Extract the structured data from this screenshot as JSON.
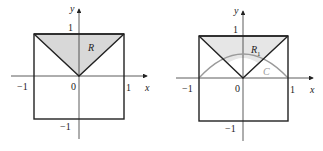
{
  "figures": [
    {
      "id": "left",
      "region_label": "R",
      "region_subscript": "",
      "axis_x_label": "x",
      "axis_y_label": "y",
      "ticks": {
        "x_neg": "−1",
        "x_pos": "1",
        "y_pos": "1",
        "y_neg": "−1",
        "origin": "0"
      },
      "fill_color": "#d8d8d8",
      "has_curve": false
    },
    {
      "id": "right",
      "region_label": "R",
      "region_subscript": "1",
      "curve_label": "C",
      "axis_x_label": "x",
      "axis_y_label": "y",
      "ticks": {
        "x_neg": "−1",
        "x_pos": "1",
        "y_pos": "1",
        "y_neg": "−1",
        "origin": "0"
      },
      "fill_color": "#e6e6e6",
      "curve_color": "#9a9a9a",
      "has_curve": true
    }
  ]
}
